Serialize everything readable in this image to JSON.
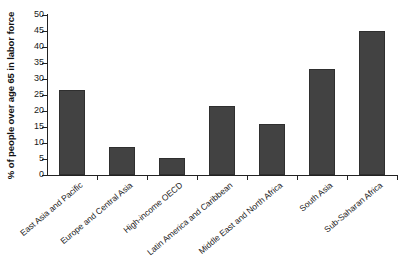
{
  "chart_data": {
    "type": "bar",
    "title": "",
    "xlabel": "",
    "ylabel": "% of people over age 65 in labor force",
    "ylim": [
      0,
      50
    ],
    "ytick_labels": [
      "0",
      "5",
      "10",
      "15",
      "20",
      "25",
      "30",
      "35",
      "40",
      "45",
      "50"
    ],
    "yticks": [
      0,
      5,
      10,
      15,
      20,
      25,
      30,
      35,
      40,
      45,
      50
    ],
    "grid": false,
    "legend": "none",
    "bar_color": "#424242",
    "axis_color": "#222222",
    "categories": [
      "East Asia and Pacific",
      "Europe and Central Asia",
      "High-income OECD",
      "Latin America and Caribbean",
      "Middle East and North Africa",
      "South Asia",
      "Sub-Saharan Africa"
    ],
    "values": [
      26.5,
      8.7,
      5.3,
      21.5,
      16.0,
      33.0,
      45.0
    ]
  }
}
